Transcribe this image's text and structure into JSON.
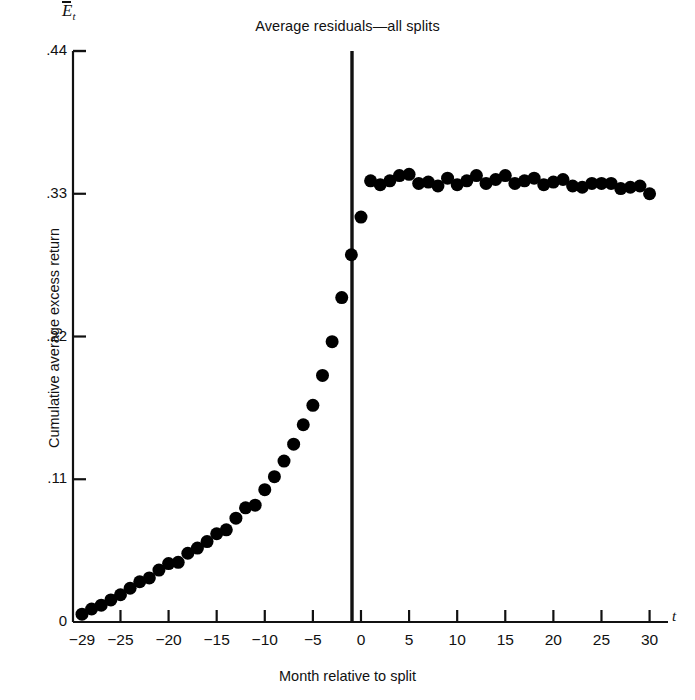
{
  "chart_data": {
    "type": "scatter",
    "title": "Average residuals—all splits",
    "xlabel": "Month relative to split",
    "ylabel": "Cumulative average excess return",
    "y_axis_symbol": "E",
    "y_axis_symbol_sub": "t",
    "x_axis_symbol": "t",
    "xlim": [
      -30,
      32
    ],
    "ylim": [
      0,
      0.44
    ],
    "grid": false,
    "legend": null,
    "xticks": [
      -29,
      -25,
      -20,
      -15,
      -10,
      -5,
      0,
      5,
      10,
      15,
      20,
      25,
      30
    ],
    "xtick_labels": [
      "−29",
      "−25",
      "−20",
      "−15",
      "−10",
      "−5",
      "0",
      "5",
      "10",
      "15",
      "20",
      "25",
      "30"
    ],
    "yticks": [
      0,
      0.11,
      0.22,
      0.33,
      0.44
    ],
    "ytick_labels": [
      "0",
      ".11",
      ".22",
      ".33",
      ".44"
    ],
    "annotations": [
      {
        "name": "split-event-line",
        "x": 0,
        "label": "split month (t=0) vertical rule"
      }
    ],
    "marker": {
      "shape": "circle",
      "color": "#000000",
      "radius_px": 6.5
    },
    "series": [
      {
        "name": "Cumulative average excess return",
        "x": [
          -29,
          -28,
          -27,
          -26,
          -25,
          -24,
          -23,
          -22,
          -21,
          -20,
          -19,
          -18,
          -17,
          -16,
          -15,
          -14,
          -13,
          -12,
          -11,
          -10,
          -9,
          -8,
          -7,
          -6,
          -5,
          -4,
          -3,
          -2,
          -1,
          0,
          1,
          2,
          3,
          4,
          5,
          6,
          7,
          8,
          9,
          10,
          11,
          12,
          13,
          14,
          15,
          16,
          17,
          18,
          19,
          20,
          21,
          22,
          23,
          24,
          25,
          26,
          27,
          28,
          29,
          30
        ],
        "values": [
          0.006,
          0.01,
          0.013,
          0.017,
          0.021,
          0.026,
          0.031,
          0.034,
          0.04,
          0.045,
          0.046,
          0.053,
          0.057,
          0.062,
          0.068,
          0.071,
          0.08,
          0.088,
          0.09,
          0.102,
          0.112,
          0.124,
          0.137,
          0.152,
          0.167,
          0.19,
          0.216,
          0.25,
          0.283,
          0.312,
          0.34,
          0.337,
          0.34,
          0.344,
          0.345,
          0.338,
          0.339,
          0.336,
          0.342,
          0.337,
          0.34,
          0.344,
          0.338,
          0.341,
          0.344,
          0.338,
          0.34,
          0.342,
          0.337,
          0.339,
          0.341,
          0.336,
          0.335,
          0.338,
          0.338,
          0.338,
          0.334,
          0.335,
          0.336,
          0.33
        ]
      }
    ]
  },
  "axes_geometry": {
    "x_axis_y_px": 622,
    "y_axis_x_px": 73,
    "x_px_per_unit": 9.62,
    "y_px_per_unit": 1297.7,
    "plot_left_px": 73,
    "plot_top_px": 51
  }
}
